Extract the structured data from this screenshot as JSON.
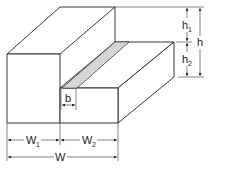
{
  "diagram": {
    "labels": {
      "h1": "h",
      "h1_sub": "1",
      "h2": "h",
      "h2_sub": "2",
      "h": "h",
      "b": "b",
      "w1": "W",
      "w1_sub": "1",
      "w2": "W",
      "w2_sub": "2",
      "w": "W"
    },
    "colors": {
      "line": "#222222",
      "hatch": "#888888",
      "background": "#ffffff"
    }
  }
}
